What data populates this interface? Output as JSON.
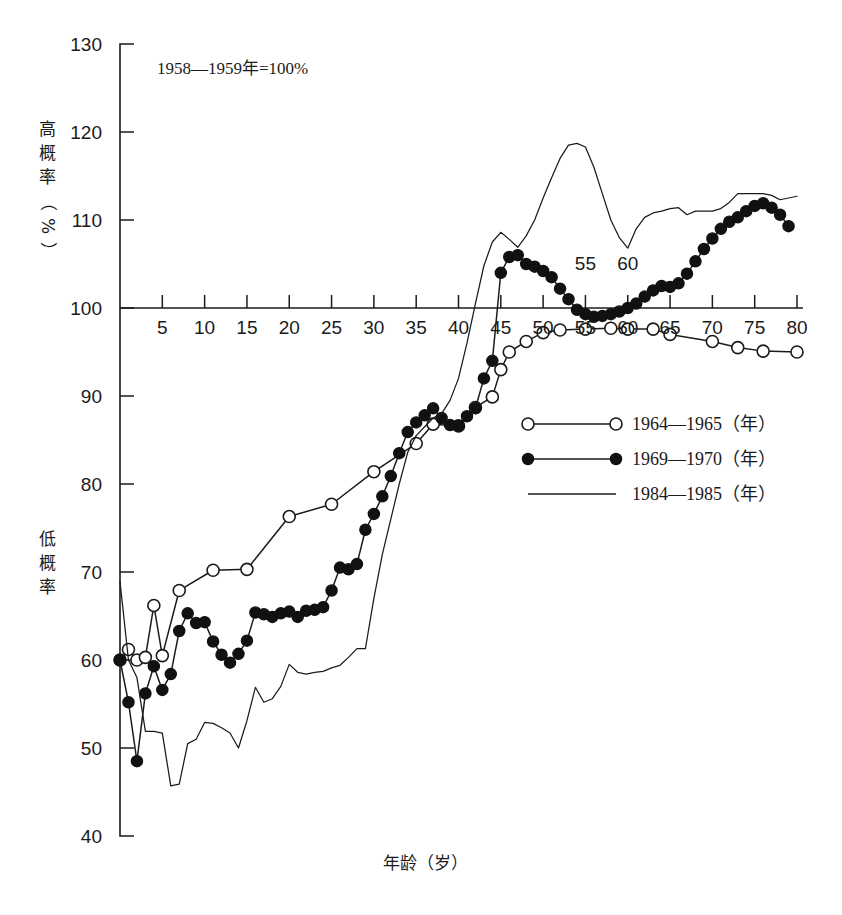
{
  "figure": {
    "note": "1958—1959年=100%",
    "x_axis_title": "年龄（岁）",
    "y_axis_title_upper": "高概率（%）",
    "y_axis_title_lower": "低概率",
    "inline_labels": [
      {
        "text": "55",
        "x": 55,
        "y": 104.3
      },
      {
        "text": "60",
        "x": 60,
        "y": 104.3
      }
    ]
  },
  "legend": {
    "position": "center-right",
    "items": [
      {
        "label": "1964—1965（年）",
        "marker": "open-circle",
        "line": true
      },
      {
        "label": "1969—1970（年）",
        "marker": "filled-circle",
        "line": true
      },
      {
        "label": "1984—1985（年）",
        "marker": "none",
        "line": true
      }
    ]
  },
  "chart_data": {
    "type": "line",
    "title": "",
    "subtitle": "1958—1959年=100%",
    "xlabel": "年龄（岁）",
    "ylabel": "高概率（%） / 低概率",
    "xlim": [
      0,
      80
    ],
    "ylim": [
      40,
      130
    ],
    "xticks": [
      0,
      5,
      10,
      15,
      20,
      25,
      30,
      35,
      40,
      45,
      50,
      55,
      60,
      65,
      70,
      75,
      80
    ],
    "xtick_labels": [
      "",
      "5",
      "10",
      "15",
      "20",
      "25",
      "30",
      "35",
      "40",
      "45",
      "50",
      "55",
      "60",
      "65",
      "70",
      "75",
      "80"
    ],
    "yticks": [
      40,
      50,
      60,
      70,
      80,
      90,
      100,
      110,
      120,
      130
    ],
    "ytick_labels": [
      "40",
      "50",
      "60",
      "70",
      "80",
      "90",
      "100",
      "110",
      "120",
      "130"
    ],
    "grid": false,
    "baseline": 100,
    "series": [
      {
        "name": "1964—1965（年）",
        "marker": "open-circle",
        "x": [
          0,
          1,
          2,
          3,
          4,
          5,
          7,
          11,
          15,
          20,
          25,
          30,
          35,
          37,
          40,
          42,
          44,
          45,
          46,
          48,
          50,
          52,
          55,
          58,
          60,
          63,
          65,
          70,
          73,
          76,
          80
        ],
        "y": [
          60.0,
          61.2,
          60.0,
          60.3,
          66.2,
          60.5,
          67.9,
          70.2,
          70.3,
          76.3,
          77.7,
          81.4,
          84.6,
          86.8,
          86.6,
          88.7,
          89.9,
          93.0,
          95.0,
          96.2,
          97.2,
          97.5,
          97.6,
          97.7,
          97.6,
          97.6,
          97.0,
          96.2,
          95.5,
          95.1,
          95.0
        ]
      },
      {
        "name": "1969—1970（年）",
        "marker": "filled-circle",
        "x": [
          0,
          1,
          2,
          3,
          4,
          5,
          6,
          7,
          8,
          9,
          10,
          11,
          12,
          13,
          14,
          15,
          16,
          17,
          18,
          19,
          20,
          21,
          22,
          23,
          24,
          25,
          26,
          27,
          28,
          29,
          30,
          31,
          32,
          33,
          34,
          35,
          36,
          37,
          38,
          39,
          40,
          41,
          42,
          43,
          44,
          45,
          46,
          47,
          48,
          49,
          50,
          51,
          52,
          53,
          54,
          55,
          56,
          57,
          58,
          59,
          60,
          61,
          62,
          63,
          64,
          65,
          66,
          67,
          68,
          69,
          70,
          71,
          72,
          73,
          74,
          75,
          76,
          77,
          78,
          79
        ],
        "y": [
          60.0,
          55.2,
          48.5,
          56.2,
          59.3,
          56.6,
          58.4,
          63.3,
          65.3,
          64.2,
          64.3,
          62.1,
          60.6,
          59.7,
          60.7,
          62.2,
          65.4,
          65.2,
          64.9,
          65.3,
          65.5,
          64.9,
          65.6,
          65.7,
          66.0,
          67.9,
          70.5,
          70.3,
          70.9,
          74.8,
          76.6,
          78.6,
          80.9,
          83.5,
          85.9,
          87.0,
          87.8,
          88.6,
          87.5,
          86.7,
          86.6,
          87.7,
          88.6,
          92.0,
          94.0,
          104.0,
          105.8,
          106.0,
          105.0,
          104.7,
          104.2,
          103.5,
          102.2,
          101.0,
          99.8,
          99.3,
          99.0,
          99.1,
          99.3,
          99.6,
          100.0,
          100.5,
          101.3,
          102.0,
          102.5,
          102.4,
          102.8,
          103.9,
          105.3,
          106.7,
          107.9,
          109.0,
          109.8,
          110.3,
          111.0,
          111.6,
          111.9,
          111.4,
          110.6,
          109.3
        ]
      },
      {
        "name": "1984—1985（年）",
        "marker": "none",
        "x": [
          0,
          1,
          2,
          3,
          4,
          5,
          6,
          7,
          8,
          9,
          10,
          11,
          12,
          13,
          14,
          15,
          16,
          17,
          18,
          19,
          20,
          21,
          22,
          23,
          24,
          25,
          26,
          27,
          28,
          29,
          30,
          31,
          32,
          33,
          34,
          35,
          36,
          37,
          38,
          39,
          40,
          41,
          42,
          43,
          44,
          45,
          46,
          47,
          48,
          49,
          50,
          51,
          52,
          53,
          54,
          55,
          56,
          57,
          58,
          59,
          60,
          61,
          62,
          63,
          64,
          65,
          66,
          67,
          68,
          69,
          70,
          71,
          72,
          73,
          74,
          75,
          76,
          77,
          78,
          79,
          80
        ],
        "y": [
          68.9,
          60.0,
          58.0,
          51.9,
          51.9,
          51.7,
          45.7,
          45.9,
          50.5,
          51.0,
          52.9,
          52.8,
          52.3,
          51.7,
          50.0,
          53.1,
          56.9,
          55.2,
          55.6,
          57.0,
          59.5,
          58.6,
          58.4,
          58.6,
          58.7,
          59.1,
          59.4,
          60.3,
          61.3,
          61.3,
          67.0,
          72.0,
          76.0,
          80.0,
          83.6,
          85.5,
          86.5,
          87.5,
          88.0,
          89.5,
          92.0,
          96.0,
          100.5,
          104.8,
          107.5,
          108.6,
          107.8,
          106.9,
          108.2,
          110.0,
          112.5,
          114.8,
          117.0,
          118.5,
          118.7,
          118.3,
          116.0,
          113.0,
          110.0,
          108.0,
          106.8,
          109.0,
          110.3,
          110.8,
          111.0,
          111.3,
          111.4,
          110.6,
          111.0,
          111.0,
          111.0,
          111.3,
          112.0,
          113.0,
          113.0,
          113.0,
          113.0,
          112.8,
          112.3,
          112.5,
          112.7
        ]
      }
    ]
  }
}
